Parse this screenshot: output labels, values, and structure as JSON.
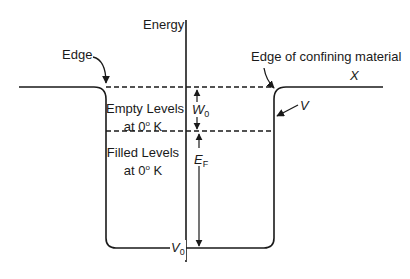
{
  "diagram": {
    "axis": {
      "label": "Energy",
      "x_label": "X"
    },
    "annotations": {
      "edge": "Edge",
      "edge_confining": "Edge of confining material",
      "potential": "V"
    },
    "regions": {
      "empty": {
        "line1": "Empty Levels",
        "line2_pre": "at 0",
        "line2_deg": "o",
        "line2_post": " K"
      },
      "filled": {
        "line1": "Filled Levels",
        "line2_pre": "at 0",
        "line2_deg": "o",
        "line2_post": " K"
      }
    },
    "quantities": {
      "work_function": {
        "symbol": "W",
        "subscript": "0"
      },
      "fermi_energy": {
        "symbol": "E",
        "subscript": "F"
      },
      "well_depth": {
        "symbol": "V",
        "subscript": "0"
      }
    },
    "colors": {
      "line": "#1a1a1a",
      "background": "#ffffff"
    }
  }
}
